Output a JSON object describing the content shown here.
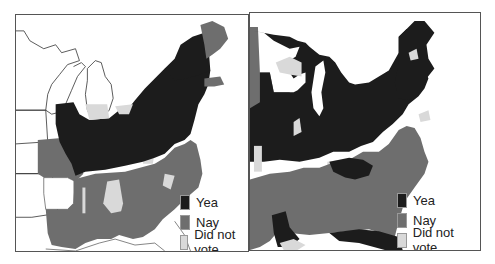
{
  "colors": {
    "yea": "#1c1c1c",
    "nay": "#6e6e6e",
    "did_not_vote": "#d9d9d9",
    "no_data": "#ffffff",
    "frame": "#555555",
    "outline": "#333333"
  },
  "maps": [
    {
      "id": "left",
      "region": "Eastern United States (earlier period, excludes upper Midwest)",
      "legend": [
        {
          "key": "yea",
          "label": "Yea"
        },
        {
          "key": "nay",
          "label": "Nay"
        },
        {
          "key": "did_not_vote",
          "label": "Did not vote"
        }
      ]
    },
    {
      "id": "right",
      "region": "Eastern United States (later period, includes upper Midwest)",
      "legend": [
        {
          "key": "yea",
          "label": "Yea"
        },
        {
          "key": "nay",
          "label": "Nay"
        },
        {
          "key": "did_not_vote",
          "label": "Did not vote"
        }
      ]
    }
  ]
}
